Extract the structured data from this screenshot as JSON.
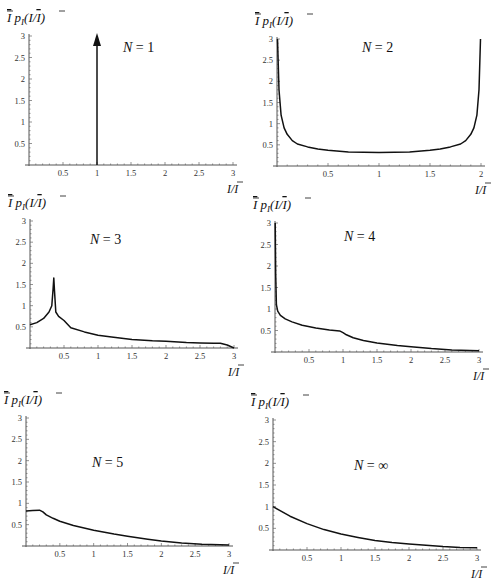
{
  "figure": {
    "y_axis_label": "Ī p_I(I/Ī)",
    "x_axis_label": "I/Ī"
  },
  "chart_data": [
    {
      "type": "line",
      "title": "N = 1",
      "xlabel": "I/Ī",
      "ylabel": "Ī p_I(I/Ī)",
      "xlim": [
        0,
        3
      ],
      "ylim": [
        0,
        3
      ],
      "xticks": [
        "0.5",
        "1",
        "1.5",
        "2",
        "2.5",
        "3"
      ],
      "yticks": [
        "0.5",
        "1",
        "1.5",
        "2",
        "2.5",
        "3"
      ],
      "annotation": "Delta function (arrow) at I/Ī = 1",
      "series": [
        {
          "name": "N=1",
          "x": [
            1,
            1
          ],
          "y": [
            0,
            3
          ],
          "style": "arrow"
        }
      ],
      "px": {
        "x0": 29,
        "x1": 233,
        "y0": 165,
        "y1": 36,
        "xmax": 3,
        "label_x": 123,
        "label_y": 52
      }
    },
    {
      "type": "line",
      "title": "N = 2",
      "xlabel": "I/Ī",
      "ylabel": "Ī p_I(I/Ī)",
      "xlim": [
        0,
        2
      ],
      "ylim": [
        0,
        3
      ],
      "xticks": [
        "0.5",
        "1",
        "1.5",
        "2"
      ],
      "yticks": [
        "0.5",
        "1",
        "1.5",
        "2",
        "2.5",
        "3"
      ],
      "series": [
        {
          "name": "N=2",
          "x": [
            0.005,
            0.01,
            0.02,
            0.04,
            0.07,
            0.1,
            0.15,
            0.2,
            0.3,
            0.4,
            0.5,
            0.7,
            1.0,
            1.3,
            1.5,
            1.6,
            1.7,
            1.8,
            1.85,
            1.9,
            1.93,
            1.96,
            1.98,
            1.99,
            1.995
          ],
          "y": [
            3.0,
            2.6,
            1.8,
            1.2,
            0.9,
            0.75,
            0.6,
            0.52,
            0.45,
            0.4,
            0.37,
            0.33,
            0.32,
            0.33,
            0.37,
            0.4,
            0.45,
            0.52,
            0.6,
            0.75,
            0.9,
            1.2,
            1.8,
            2.6,
            3.0
          ]
        }
      ],
      "px": {
        "x0": 277,
        "x1": 481,
        "y0": 166,
        "y1": 39,
        "xmax": 2,
        "label_x": 362,
        "label_y": 52
      }
    },
    {
      "type": "line",
      "title": "N = 3",
      "xlabel": "I/Ī",
      "ylabel": "Ī p_I(I/Ī)",
      "xlim": [
        0,
        3
      ],
      "ylim": [
        0,
        3
      ],
      "xticks": [
        "0.5",
        "1",
        "1.5",
        "2",
        "2.5",
        "3"
      ],
      "yticks": [
        "0.5",
        "1",
        "1.5",
        "2",
        "2.5",
        "3"
      ],
      "series": [
        {
          "name": "N=3",
          "x": [
            0.0,
            0.1,
            0.2,
            0.28,
            0.32,
            0.34,
            0.35,
            0.36,
            0.38,
            0.42,
            0.5,
            0.6,
            0.8,
            1.0,
            1.2,
            1.5,
            1.8,
            2.0,
            2.3,
            2.5,
            2.7,
            2.8,
            2.9,
            3.0
          ],
          "y": [
            0.55,
            0.6,
            0.7,
            0.85,
            1.0,
            1.4,
            1.65,
            1.35,
            0.85,
            0.75,
            0.65,
            0.48,
            0.38,
            0.3,
            0.26,
            0.2,
            0.17,
            0.16,
            0.13,
            0.12,
            0.11,
            0.11,
            0.07,
            0.0
          ]
        }
      ],
      "px": {
        "x0": 30,
        "x1": 234,
        "y0": 348,
        "y1": 221,
        "xmax": 3,
        "label_x": 90,
        "label_y": 244
      }
    },
    {
      "type": "line",
      "title": "N = 4",
      "xlabel": "I/Ī",
      "ylabel": "Ī p_I(I/Ī)",
      "xlim": [
        0,
        3
      ],
      "ylim": [
        0,
        3
      ],
      "xticks": [
        "0.5",
        "1",
        "1.5",
        "2",
        "2.5",
        "3"
      ],
      "yticks": [
        "0.5",
        "1",
        "1.5",
        "2",
        "2.5",
        "3"
      ],
      "series": [
        {
          "name": "N=4",
          "x": [
            0.003,
            0.01,
            0.02,
            0.04,
            0.08,
            0.15,
            0.25,
            0.4,
            0.6,
            0.8,
            0.95,
            1.0,
            1.05,
            1.15,
            1.3,
            1.5,
            1.8,
            2.0,
            2.3,
            2.6,
            3.0
          ],
          "y": [
            3.0,
            1.8,
            1.1,
            0.95,
            0.85,
            0.77,
            0.7,
            0.62,
            0.56,
            0.51,
            0.49,
            0.45,
            0.4,
            0.33,
            0.27,
            0.21,
            0.15,
            0.12,
            0.08,
            0.05,
            0.03
          ]
        }
      ],
      "px": {
        "x0": 275,
        "x1": 479,
        "y0": 352,
        "y1": 223,
        "xmax": 3,
        "label_x": 344,
        "label_y": 241
      }
    },
    {
      "type": "line",
      "title": "N = 5",
      "xlabel": "I/Ī",
      "ylabel": "Ī p_I(I/Ī)",
      "xlim": [
        0,
        3
      ],
      "ylim": [
        0,
        3
      ],
      "xticks": [
        "0.5",
        "1",
        "1.5",
        "2",
        "2.5",
        "3"
      ],
      "yticks": [
        "0.5",
        "1",
        "1.5",
        "2",
        "2.5",
        "3"
      ],
      "series": [
        {
          "name": "N=5",
          "x": [
            0.0,
            0.1,
            0.2,
            0.25,
            0.3,
            0.4,
            0.5,
            0.7,
            1.0,
            1.3,
            1.5,
            1.8,
            2.0,
            2.3,
            2.6,
            3.0
          ],
          "y": [
            0.82,
            0.83,
            0.84,
            0.8,
            0.73,
            0.65,
            0.58,
            0.48,
            0.37,
            0.28,
            0.23,
            0.16,
            0.12,
            0.07,
            0.04,
            0.02
          ]
        }
      ],
      "px": {
        "x0": 26,
        "x1": 229,
        "y0": 546,
        "y1": 418,
        "xmax": 3,
        "label_x": 92,
        "label_y": 467
      }
    },
    {
      "type": "line",
      "title": "N = ∞",
      "xlabel": "I/Ī",
      "ylabel": "Ī p_I(I/Ī)",
      "xlim": [
        0,
        3
      ],
      "ylim": [
        0,
        3
      ],
      "xticks": [
        "0.5",
        "1",
        "1.5",
        "2",
        "2.5",
        "3"
      ],
      "yticks": [
        "0.5",
        "1",
        "1.5",
        "2",
        "2.5",
        "3"
      ],
      "annotation": "Exponential distribution e^(-I/Ī)",
      "series": [
        {
          "name": "N=inf",
          "x": [
            0.0,
            0.25,
            0.5,
            0.75,
            1.0,
            1.25,
            1.5,
            1.75,
            2.0,
            2.25,
            2.5,
            2.75,
            3.0
          ],
          "y": [
            1.0,
            0.78,
            0.61,
            0.47,
            0.37,
            0.29,
            0.22,
            0.17,
            0.14,
            0.11,
            0.08,
            0.06,
            0.05
          ]
        }
      ],
      "px": {
        "x0": 273,
        "x1": 477,
        "y0": 550,
        "y1": 420,
        "xmax": 3,
        "label_x": 354,
        "label_y": 470
      }
    }
  ]
}
